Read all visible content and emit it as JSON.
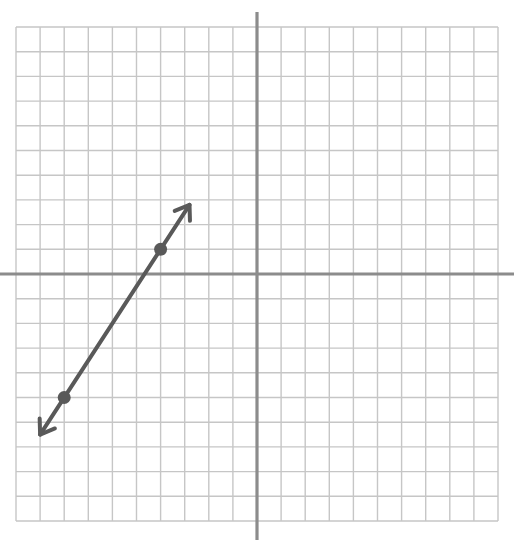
{
  "chart_data": {
    "type": "line",
    "title": "",
    "xlabel": "",
    "ylabel": "",
    "xlim": [
      -10,
      10
    ],
    "ylim": [
      -10,
      10
    ],
    "grid": true,
    "grid_step": 1,
    "axes": {
      "x_axis_visible": true,
      "y_axis_visible": true,
      "tick_labels": false
    },
    "series": [
      {
        "name": "line",
        "kind": "line-with-arrows",
        "slope": 1.5,
        "intercept": 7,
        "arrow_ends": [
          {
            "x": -9,
            "y": -6.5
          },
          {
            "x": -2.8,
            "y": 2.8
          }
        ],
        "points": [
          {
            "x": -8,
            "y": -5
          },
          {
            "x": -4,
            "y": 1
          }
        ],
        "color": "#595959"
      }
    ],
    "colors": {
      "grid": "#c6c6c6",
      "axis": "#8c8c8c",
      "line": "#595959"
    }
  }
}
